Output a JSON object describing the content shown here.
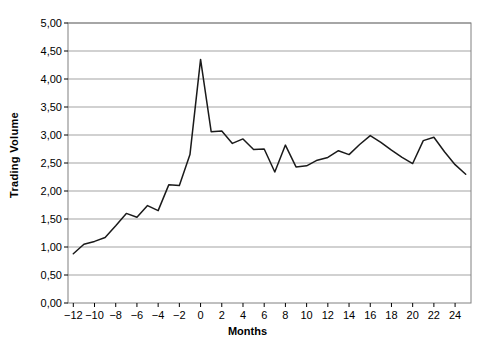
{
  "chart_data": {
    "type": "line",
    "title": "",
    "subtitle": "",
    "xlabel": "Months",
    "ylabel": "Trading Volume",
    "xlim": [
      -12.5,
      25.5
    ],
    "ylim": [
      0.0,
      5.0
    ],
    "grid": true,
    "grid_axis": "y",
    "legend": false,
    "legend_position": "none",
    "line_color": "#1a1a1a",
    "grid_color": "#999999",
    "axis_color": "#808080",
    "background": "#ffffff",
    "y_ticks": [
      0.0,
      0.5,
      1.0,
      1.5,
      2.0,
      2.5,
      3.0,
      3.5,
      4.0,
      4.5,
      5.0
    ],
    "y_tick_labels": [
      "0,00",
      "0,50",
      "1,00",
      "1,50",
      "2,00",
      "2,50",
      "3,00",
      "3,50",
      "4,00",
      "4,50",
      "5,00"
    ],
    "x_ticks": [
      -12,
      -10,
      -8,
      -6,
      -4,
      -2,
      0,
      2,
      4,
      6,
      8,
      10,
      12,
      14,
      16,
      18,
      20,
      22,
      24
    ],
    "x_tick_labels": [
      "−12",
      "−10",
      "−8",
      "−6",
      "−4",
      "−2",
      "0",
      "2",
      "4",
      "6",
      "8",
      "10",
      "12",
      "14",
      "16",
      "18",
      "20",
      "22",
      "24"
    ],
    "x": [
      -12,
      -11,
      -10,
      -9,
      -8,
      -7,
      -6,
      -5,
      -4,
      -3,
      -2,
      -1,
      0,
      1,
      2,
      3,
      4,
      5,
      6,
      7,
      8,
      9,
      10,
      11,
      12,
      13,
      14,
      15,
      16,
      17,
      18,
      19,
      20,
      21,
      22,
      23,
      24,
      25
    ],
    "values": [
      0.88,
      1.05,
      1.1,
      1.17,
      1.38,
      1.6,
      1.53,
      1.74,
      1.65,
      2.11,
      2.1,
      2.65,
      4.35,
      3.06,
      3.07,
      2.85,
      2.93,
      2.74,
      2.75,
      2.34,
      2.82,
      2.43,
      2.45,
      2.55,
      2.6,
      2.72,
      2.65,
      2.83,
      2.99,
      2.87,
      2.73,
      2.6,
      2.49,
      2.9,
      2.96,
      2.7,
      2.47,
      2.3
    ],
    "series": [
      {
        "name": "Trading Volume",
        "values": [
          0.88,
          1.05,
          1.1,
          1.17,
          1.38,
          1.6,
          1.53,
          1.74,
          1.65,
          2.11,
          2.1,
          2.65,
          4.35,
          3.06,
          3.07,
          2.85,
          2.93,
          2.74,
          2.75,
          2.34,
          2.82,
          2.43,
          2.45,
          2.55,
          2.6,
          2.72,
          2.65,
          2.83,
          2.99,
          2.87,
          2.73,
          2.6,
          2.49,
          2.9,
          2.96,
          2.7,
          2.47,
          2.3
        ]
      }
    ],
    "annotations": []
  }
}
